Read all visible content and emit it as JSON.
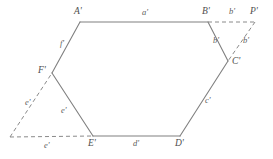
{
  "figure": {
    "kind": "geometric-line-diagram",
    "background_color": "#ffffff",
    "solid_stroke_color": "#808080",
    "dashed_stroke_color": "#8a8a8a",
    "label_color": "#5a5a5a"
  },
  "vertices": [
    {
      "id": "A",
      "label": "A'",
      "x": 80,
      "y": 22,
      "label_x": 74,
      "label_y": 7
    },
    {
      "id": "B",
      "label": "B'",
      "x": 208,
      "y": 22,
      "label_x": 202,
      "label_y": 7
    },
    {
      "id": "C",
      "label": "C'",
      "x": 228,
      "y": 61,
      "label_x": 232,
      "label_y": 57
    },
    {
      "id": "D",
      "label": "D'",
      "x": 180,
      "y": 136,
      "label_x": 175,
      "label_y": 139
    },
    {
      "id": "E",
      "label": "E'",
      "x": 93,
      "y": 136,
      "label_x": 88,
      "label_y": 139
    },
    {
      "id": "F",
      "label": "F'",
      "x": 52,
      "y": 73,
      "label_x": 38,
      "label_y": 66
    },
    {
      "id": "P",
      "label": "P'",
      "x": 255,
      "y": 22,
      "label_x": 250,
      "label_y": 7
    },
    {
      "id": "G",
      "label": "",
      "x": 10,
      "y": 137,
      "label_x": 0,
      "label_y": 0
    }
  ],
  "solid_edges": [
    {
      "from": "A",
      "to": "B",
      "label": "a'",
      "label_x": 142,
      "label_y": 8
    },
    {
      "from": "B",
      "to": "C",
      "label": "b'",
      "label_x": 213,
      "label_y": 36
    },
    {
      "from": "C",
      "to": "D",
      "label": "c'",
      "label_x": 205,
      "label_y": 96
    },
    {
      "from": "D",
      "to": "E",
      "label": "d'",
      "label_x": 133,
      "label_y": 139
    },
    {
      "from": "E",
      "to": "F",
      "label": "e'",
      "label_x": 61,
      "label_y": 106
    },
    {
      "from": "F",
      "to": "A",
      "label": "f'",
      "label_x": 60,
      "label_y": 39
    }
  ],
  "dashed_edges": [
    {
      "from": "B",
      "to": "P",
      "label": "b'",
      "label_x": 229,
      "label_y": 7
    },
    {
      "from": "P",
      "to": "C",
      "label": "b'",
      "label_x": 243,
      "label_y": 36
    },
    {
      "from": "G",
      "to": "F",
      "label": "e'",
      "label_x": 25,
      "label_y": 98
    },
    {
      "from": "G",
      "to": "E",
      "label": "e'",
      "label_x": 44,
      "label_y": 141
    }
  ],
  "labels": {
    "a": "a'",
    "b": "b'",
    "c": "c'",
    "d": "d'",
    "e": "e'",
    "f": "f'",
    "A": "A'",
    "B": "B'",
    "C": "C'",
    "D": "D'",
    "E": "E'",
    "F": "F'",
    "P": "P'"
  }
}
